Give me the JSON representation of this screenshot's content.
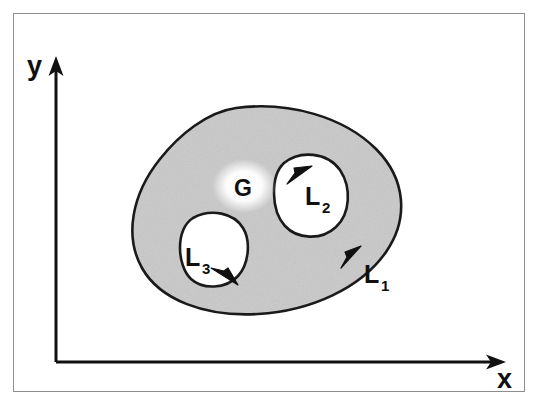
{
  "figure": {
    "caption_region_label": "G",
    "axes": {
      "x_label": "x",
      "y_label": "y",
      "x_axis_name": "horizontal-axis",
      "y_axis_name": "vertical-axis",
      "origin_x": 56,
      "origin_y": 362,
      "x_axis_end": 505,
      "y_axis_end": 62
    },
    "region": {
      "name": "G",
      "fill_color": "#c9c9c9",
      "stroke_color": "#1a1a1a",
      "description": "multiply-connected shaded region"
    },
    "boundaries": [
      {
        "id": "L1",
        "label_base": "L",
        "label_sub": "1",
        "kind": "outer-boundary",
        "orientation": "counterclockwise",
        "arrow_x": 352,
        "arrow_y": 258,
        "label_x": 366,
        "label_y": 282
      },
      {
        "id": "L2",
        "label_base": "L",
        "label_sub": "2",
        "kind": "inner-hole-boundary",
        "orientation": "clockwise",
        "arrow_x": 303,
        "arrow_y": 175,
        "label_x": 308,
        "label_y": 205
      },
      {
        "id": "L3",
        "label_base": "L",
        "label_sub": "3",
        "kind": "inner-hole-boundary",
        "orientation": "clockwise",
        "arrow_x": 219,
        "arrow_y": 279,
        "label_x": 185,
        "label_y": 265
      }
    ],
    "region_label": {
      "text": "G",
      "x": 244,
      "y": 191
    },
    "colors": {
      "frame_border": "#8d8d8d",
      "ink": "#101010",
      "shade": "#c9c9c9",
      "hole_fill": "#ffffff",
      "background": "#ffffff"
    }
  }
}
